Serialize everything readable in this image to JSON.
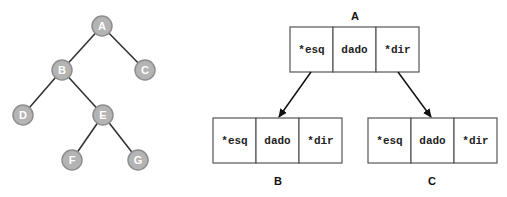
{
  "tree": {
    "nodes": [
      {
        "id": "A",
        "label": "A",
        "x": 102,
        "y": 26
      },
      {
        "id": "B",
        "label": "B",
        "x": 62,
        "y": 70
      },
      {
        "id": "C",
        "label": "C",
        "x": 145,
        "y": 70
      },
      {
        "id": "D",
        "label": "D",
        "x": 23,
        "y": 115
      },
      {
        "id": "E",
        "label": "E",
        "x": 103,
        "y": 115
      },
      {
        "id": "F",
        "label": "F",
        "x": 72,
        "y": 160
      },
      {
        "id": "G",
        "label": "G",
        "x": 138,
        "y": 160
      }
    ],
    "edges": [
      [
        "A",
        "B"
      ],
      [
        "A",
        "C"
      ],
      [
        "B",
        "D"
      ],
      [
        "B",
        "E"
      ],
      [
        "E",
        "F"
      ],
      [
        "E",
        "G"
      ]
    ],
    "colors": {
      "node_fill": "#b4b4b4",
      "node_stroke": "#8e8e8e",
      "edge": "#333333"
    }
  },
  "structs": {
    "fields": [
      "*esq",
      "dado",
      "*dir"
    ],
    "A": {
      "label": "A",
      "fields": [
        "*esq",
        "dado",
        "*dir"
      ]
    },
    "B": {
      "label": "B",
      "fields": [
        "*esq",
        "dado",
        "*dir"
      ]
    },
    "C": {
      "label": "C",
      "fields": [
        "*esq",
        "dado",
        "*dir"
      ]
    }
  }
}
